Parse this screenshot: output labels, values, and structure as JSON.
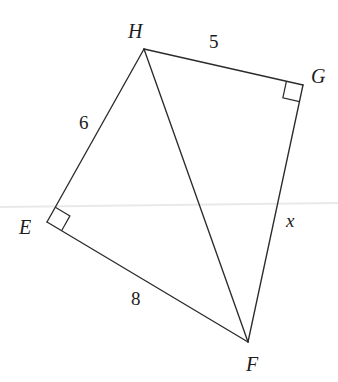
{
  "figure": {
    "type": "geometry-diagram",
    "width": 338,
    "height": 382,
    "background_color": "#ffffff",
    "line_color": "#2b2b2b",
    "text_color": "#1c1c1c",
    "artifact_color": "#e9e9e9",
    "vertices": [
      {
        "id": "H",
        "label": "H",
        "x": 144,
        "y": 49,
        "label_x": 128,
        "label_y": 38
      },
      {
        "id": "G",
        "label": "G",
        "x": 303,
        "y": 85,
        "label_x": 311,
        "label_y": 83
      },
      {
        "id": "E",
        "label": "E",
        "x": 47,
        "y": 222,
        "label_x": 19,
        "label_y": 234
      },
      {
        "id": "F",
        "label": "F",
        "x": 248,
        "y": 342,
        "label_x": 246,
        "label_y": 371
      }
    ],
    "edges": [
      {
        "id": "HG",
        "from": "H",
        "to": "G",
        "label": "5",
        "label_x": 209,
        "label_y": 48,
        "italic": false
      },
      {
        "id": "HE",
        "from": "H",
        "to": "E",
        "label": "6",
        "label_x": 79,
        "label_y": 129,
        "italic": false
      },
      {
        "id": "EF",
        "from": "E",
        "to": "F",
        "label": "8",
        "label_x": 131,
        "label_y": 305,
        "italic": false
      },
      {
        "id": "GF",
        "from": "G",
        "to": "F",
        "label": "x",
        "label_x": 286,
        "label_y": 227,
        "italic": true
      },
      {
        "id": "HF",
        "from": "H",
        "to": "F",
        "label": "",
        "label_x": 0,
        "label_y": 0,
        "italic": false
      }
    ],
    "right_angles": [
      {
        "id": "angle-at-G",
        "at": "G",
        "size": 17
      },
      {
        "id": "angle-at-E",
        "at": "E",
        "size": 17
      }
    ],
    "scan_line": {
      "y_left": 207,
      "y_right": 203
    }
  }
}
